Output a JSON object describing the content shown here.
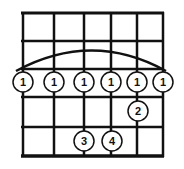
{
  "diagram": {
    "type": "guitar-chord-chart",
    "strings": 6,
    "frets_shown": 5,
    "barre": {
      "fret": 3,
      "finger": "1",
      "from_string": 1,
      "to_string": 6
    },
    "fingers": [
      {
        "string": 1,
        "fret": 3,
        "label": "1"
      },
      {
        "string": 2,
        "fret": 3,
        "label": "1"
      },
      {
        "string": 3,
        "fret": 3,
        "label": "1"
      },
      {
        "string": 4,
        "fret": 3,
        "label": "1"
      },
      {
        "string": 5,
        "fret": 3,
        "label": "1"
      },
      {
        "string": 6,
        "fret": 3,
        "label": "1"
      },
      {
        "string": 5,
        "fret": 4,
        "label": "2"
      },
      {
        "string": 3,
        "fret": 5,
        "label": "3"
      },
      {
        "string": 4,
        "fret": 5,
        "label": "4"
      }
    ],
    "colors": {
      "line": "#111111",
      "background": "#ffffff"
    }
  }
}
